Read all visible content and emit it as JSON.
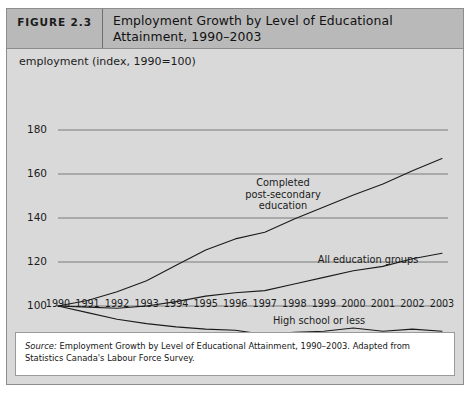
{
  "figure": {
    "number_label": "FIGURE 2.3",
    "title": "Employment Growth by Level of Educational Attainment, 1990–2003",
    "source_prefix": "Source:",
    "source_body": " Employment Growth by Level of Educational Attainment, 1990–2003. Adapted from Statistics Canada's Labour Force Survey."
  },
  "colors": {
    "frame_border": "#8d8d8d",
    "header_bg": "#b9b9b9",
    "panel_bg": "#d9d9d9",
    "gridline": "#6f6f6f",
    "series_line": "#1b1b1b",
    "source_bg": "#ffffff",
    "text": "#1b1b1b"
  },
  "chart_data": {
    "type": "line",
    "title": "Employment Growth by Level of Educational Attainment, 1990–2003",
    "xlabel": "",
    "ylabel": "employment (index, 1990=100)",
    "ylim": [
      80,
      180
    ],
    "yticks": [
      80,
      100,
      120,
      140,
      160,
      180
    ],
    "xlim": [
      1990,
      2003
    ],
    "grid": true,
    "legend_position": "inline-annotations",
    "x": [
      1990,
      1991,
      1992,
      1993,
      1994,
      1995,
      1996,
      1997,
      1998,
      1999,
      2000,
      2001,
      2002,
      2003
    ],
    "categories": [
      "1990",
      "1991",
      "1992",
      "1993",
      "1994",
      "1995",
      "1996",
      "1997",
      "1998",
      "1999",
      "2000",
      "2001",
      "2002",
      "2003"
    ],
    "series": [
      {
        "name": "Completed post-secondary education",
        "label_text": "Completed\npost-secondary\neducation",
        "values": [
          100,
          102.5,
          106.5,
          111.5,
          118.5,
          125.5,
          130.5,
          133.5,
          139.5,
          145.0,
          150.5,
          155.5,
          161.5,
          167.0
        ]
      },
      {
        "name": "All education groups",
        "label_text": "All education groups",
        "values": [
          100,
          99.5,
          99.0,
          100.0,
          102.0,
          104.5,
          106.0,
          107.0,
          110.0,
          113.0,
          116.0,
          118.0,
          121.5,
          124.0
        ]
      },
      {
        "name": "High school or less",
        "label_text": "High school or less",
        "values": [
          100,
          97.0,
          94.0,
          92.0,
          90.5,
          89.5,
          89.0,
          87.0,
          88.0,
          88.5,
          90.0,
          88.5,
          89.5,
          88.5
        ]
      }
    ]
  }
}
